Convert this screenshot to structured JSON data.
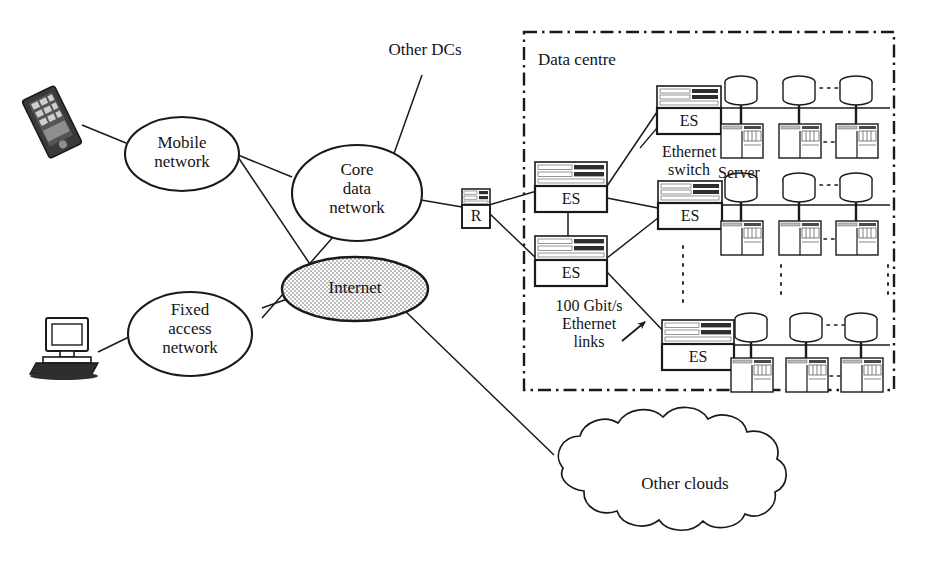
{
  "diagram": {
    "title_label": "Data centre",
    "nodes": {
      "mobile_network": "Mobile\nnetwork",
      "core_data_network": "Core\ndata\nnetwork",
      "fixed_access_network": "Fixed\naccess\nnetwork",
      "internet": "Internet",
      "other_clouds": "Other clouds",
      "router": "R"
    },
    "annotations": {
      "other_dcs": "Other DCs",
      "ethernet_switch": "Ethernet\nswitch",
      "server": "Server",
      "links_label": "100 Gbit/s\nEthernet\nlinks"
    },
    "switches": [
      {
        "id": "es-top",
        "label": "ES"
      },
      {
        "id": "es-mid-left",
        "label": "ES"
      },
      {
        "id": "es-mid-right",
        "label": "ES"
      },
      {
        "id": "es-low-left",
        "label": "ES"
      },
      {
        "id": "es-bottom",
        "label": "ES"
      }
    ],
    "server_rows": [
      {
        "id": "row-top",
        "servers": 3,
        "ellipsis": true
      },
      {
        "id": "row-middle",
        "servers": 3,
        "ellipsis": true
      },
      {
        "id": "row-bottom",
        "servers": 3,
        "ellipsis": true
      }
    ],
    "endpoints": [
      {
        "id": "smartphone",
        "icon": "smartphone-icon"
      },
      {
        "id": "desktop",
        "icon": "desktop-computer-icon"
      }
    ],
    "colors": {
      "stroke": "#1a1a1a",
      "internet_fill": "#d8d8d8",
      "device_dark": "#3a3a3a",
      "rack_dark": "#2e2e2e",
      "rack_light": "#e8e8e8"
    }
  }
}
